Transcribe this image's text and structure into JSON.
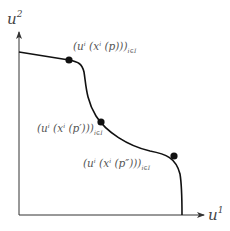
{
  "diagram": {
    "axes": {
      "x_label": "u",
      "x_sup": "1",
      "y_label": "u",
      "y_sup": "2"
    },
    "points": [
      {
        "id": "p",
        "label_main": "(u",
        "label_i": "i",
        "label_mid": " (x",
        "label_i2": "i",
        "label_arg": " (p)))",
        "label_sub": "i∈I"
      },
      {
        "id": "p-prime",
        "label_main": "(u",
        "label_i": "i",
        "label_mid": " (x",
        "label_i2": "i",
        "label_arg": " (p′)))",
        "label_sub": "i∈I"
      },
      {
        "id": "p-double-prime",
        "label_main": "(u",
        "label_i": "i",
        "label_mid": " (x",
        "label_i2": "i",
        "label_arg": " (p″)))",
        "label_sub": "i∈I"
      }
    ],
    "colors": {
      "curve": "#111111",
      "axis": "#333333",
      "label": "#555555"
    }
  }
}
